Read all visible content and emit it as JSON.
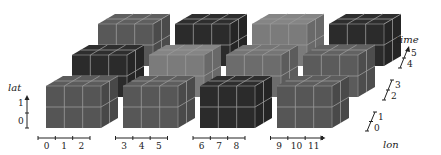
{
  "diagram": {
    "axes": {
      "lat": {
        "label": "lat",
        "ticks": [
          "0",
          "1"
        ]
      },
      "lon": {
        "label": "lon",
        "ticks": [
          "0",
          "1",
          "2",
          "3",
          "4",
          "5",
          "6",
          "7",
          "8",
          "9",
          "10",
          "11"
        ]
      },
      "time": {
        "label": "time",
        "ticks": [
          "0",
          "1",
          "2",
          "3",
          "4",
          "5"
        ]
      }
    },
    "grid": {
      "columns": 4,
      "rows": 3,
      "cells_per_cube": {
        "lon": 3,
        "lat": 2,
        "time": 2
      }
    },
    "cube_colors": {
      "front_row": [
        "#555555",
        "#575757",
        "#2b2b2b",
        "#565656"
      ],
      "middle_row": [
        "#2b2b2b",
        "#7b7b7b",
        "#6c6c6c",
        "#5b5b5b"
      ],
      "back_row": [
        "#585858",
        "#2b2b2b",
        "#7b7b7b",
        "#2b2b2b"
      ]
    },
    "grid_line_color": "#9a9a9a"
  }
}
